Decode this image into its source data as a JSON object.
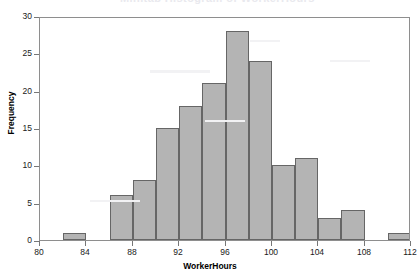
{
  "figure": {
    "cropped_title_remnant": "Minitab Histogram of WorkerHours",
    "background_color": "#ffffff",
    "frame_color": "#8e8e8e"
  },
  "chart_data": {
    "type": "bar",
    "subtype": "histogram",
    "title": "",
    "xlabel": "WorkerHours",
    "ylabel": "Frequency",
    "xlim": [
      80,
      112
    ],
    "ylim": [
      0,
      30
    ],
    "xticks": [
      80,
      84,
      88,
      92,
      96,
      100,
      104,
      108,
      112
    ],
    "yticks": [
      0,
      5,
      10,
      15,
      20,
      25,
      30
    ],
    "xtick_labels": [
      "80",
      "84",
      "88",
      "92",
      "96",
      "100",
      "104",
      "108",
      "112"
    ],
    "ytick_labels": [
      "0",
      "5",
      "10",
      "15",
      "20",
      "25",
      "30"
    ],
    "grid": false,
    "legend": null,
    "bin_width": 2,
    "bar_fill_color": "#b4b4b4",
    "bar_edge_color": "#666666",
    "bins": [
      {
        "start": 82,
        "end": 84,
        "center": 83,
        "frequency": 1
      },
      {
        "start": 86,
        "end": 88,
        "center": 87,
        "frequency": 6
      },
      {
        "start": 88,
        "end": 90,
        "center": 89,
        "frequency": 8
      },
      {
        "start": 90,
        "end": 92,
        "center": 91,
        "frequency": 15
      },
      {
        "start": 92,
        "end": 94,
        "center": 93,
        "frequency": 18
      },
      {
        "start": 94,
        "end": 96,
        "center": 95,
        "frequency": 21
      },
      {
        "start": 96,
        "end": 98,
        "center": 97,
        "frequency": 28
      },
      {
        "start": 98,
        "end": 100,
        "center": 99,
        "frequency": 24
      },
      {
        "start": 100,
        "end": 102,
        "center": 101,
        "frequency": 10
      },
      {
        "start": 102,
        "end": 104,
        "center": 103,
        "frequency": 11
      },
      {
        "start": 104,
        "end": 106,
        "center": 105,
        "frequency": 3
      },
      {
        "start": 106,
        "end": 108,
        "center": 107,
        "frequency": 4
      },
      {
        "start": 110,
        "end": 112,
        "center": 111,
        "frequency": 1
      }
    ],
    "categories": [
      "83",
      "87",
      "89",
      "91",
      "93",
      "95",
      "97",
      "99",
      "101",
      "103",
      "105",
      "107",
      "111"
    ],
    "values": [
      1,
      6,
      8,
      15,
      18,
      21,
      28,
      24,
      10,
      11,
      3,
      4,
      1
    ]
  }
}
